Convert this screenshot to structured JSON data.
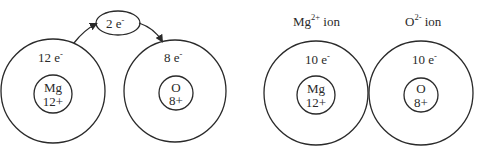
{
  "diagram": {
    "type": "ionic-bond-electron-transfer",
    "before": {
      "mg_atom": {
        "symbol": "Mg",
        "nucleus_charge": "12+",
        "electrons": "12 e",
        "electron_sup": "-"
      },
      "o_atom": {
        "symbol": "O",
        "nucleus_charge": "8+",
        "electrons": "8 e",
        "electron_sup": "-"
      },
      "transfer": {
        "label": "2 e",
        "label_sup": "-"
      }
    },
    "after": {
      "mg_ion": {
        "title": "Mg",
        "title_sup": "2+",
        "title_suffix": " ion",
        "symbol": "Mg",
        "nucleus_charge": "12+",
        "electrons": "10 e",
        "electron_sup": "-"
      },
      "o_ion": {
        "title": "O",
        "title_sup": "2-",
        "title_suffix": " ion",
        "symbol": "O",
        "nucleus_charge": "8+",
        "electrons": "10 e",
        "electron_sup": "-"
      }
    }
  }
}
